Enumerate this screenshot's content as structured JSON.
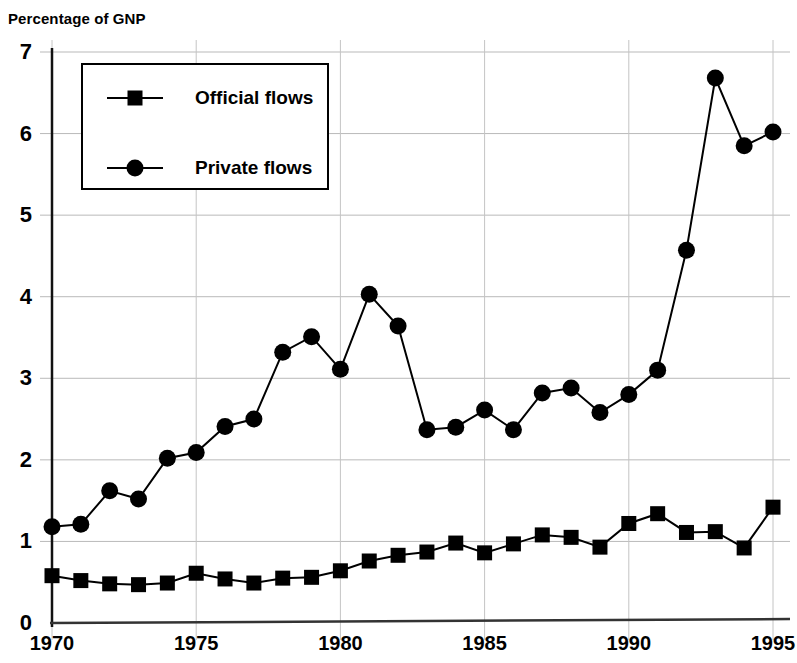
{
  "chart_data": {
    "type": "line",
    "title": "",
    "ylabel": "Percentage of GNP",
    "xlabel": "",
    "xlim": [
      1970,
      1995
    ],
    "ylim": [
      0,
      7
    ],
    "grid": true,
    "legend_position": "top-left",
    "x": [
      1970,
      1971,
      1972,
      1973,
      1974,
      1975,
      1976,
      1977,
      1978,
      1979,
      1980,
      1981,
      1982,
      1983,
      1984,
      1985,
      1986,
      1987,
      1988,
      1989,
      1990,
      1991,
      1992,
      1993,
      1994,
      1995
    ],
    "xticks": [
      1970,
      1975,
      1980,
      1985,
      1990,
      1995
    ],
    "xtick_labels": [
      "1970",
      "1975",
      "1980",
      "1985",
      "1990",
      "1995"
    ],
    "yticks": [
      0,
      1,
      2,
      3,
      4,
      5,
      6,
      7
    ],
    "ytick_labels": [
      "0",
      "1",
      "2",
      "3",
      "4",
      "5",
      "6",
      "7"
    ],
    "series": [
      {
        "name": "Official flows",
        "marker": "square",
        "color": "#000000",
        "values": [
          0.58,
          0.52,
          0.48,
          0.47,
          0.49,
          0.61,
          0.54,
          0.49,
          0.55,
          0.56,
          0.64,
          0.76,
          0.83,
          0.87,
          0.98,
          0.86,
          0.97,
          1.08,
          1.05,
          0.93,
          1.22,
          1.34,
          1.11,
          1.12,
          0.92,
          1.42
        ]
      },
      {
        "name": "Private flows",
        "marker": "circle",
        "color": "#000000",
        "values": [
          1.18,
          1.21,
          1.62,
          1.52,
          2.02,
          2.09,
          2.41,
          2.5,
          3.32,
          3.51,
          3.11,
          4.03,
          3.64,
          2.37,
          2.4,
          2.61,
          2.37,
          2.82,
          2.88,
          2.58,
          2.8,
          3.1,
          4.57,
          6.68,
          5.85,
          6.02
        ]
      }
    ]
  },
  "legend": {
    "items": [
      {
        "label": "Official flows",
        "marker": "square"
      },
      {
        "label": "Private flows",
        "marker": "circle"
      }
    ]
  }
}
